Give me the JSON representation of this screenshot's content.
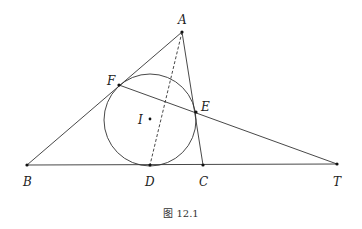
{
  "figure": {
    "caption": "图 12.1",
    "points": {
      "A": {
        "label": "A",
        "x": 182,
        "y": 32
      },
      "B": {
        "label": "B",
        "x": 27,
        "y": 165
      },
      "C": {
        "label": "C",
        "x": 203,
        "y": 165
      },
      "D": {
        "label": "D",
        "x": 150,
        "y": 165
      },
      "E": {
        "label": "E",
        "x": 196,
        "y": 112
      },
      "F": {
        "label": "F",
        "x": 119,
        "y": 85
      },
      "I": {
        "label": "I",
        "x": 150,
        "y": 119
      },
      "T": {
        "label": "T",
        "x": 337,
        "y": 164
      }
    },
    "incircle": {
      "cx": 150,
      "cy": 120,
      "r": 46
    },
    "segments": [
      "AB",
      "AC",
      "BT",
      "FT"
    ],
    "dashed_segments": [
      "AD"
    ]
  }
}
